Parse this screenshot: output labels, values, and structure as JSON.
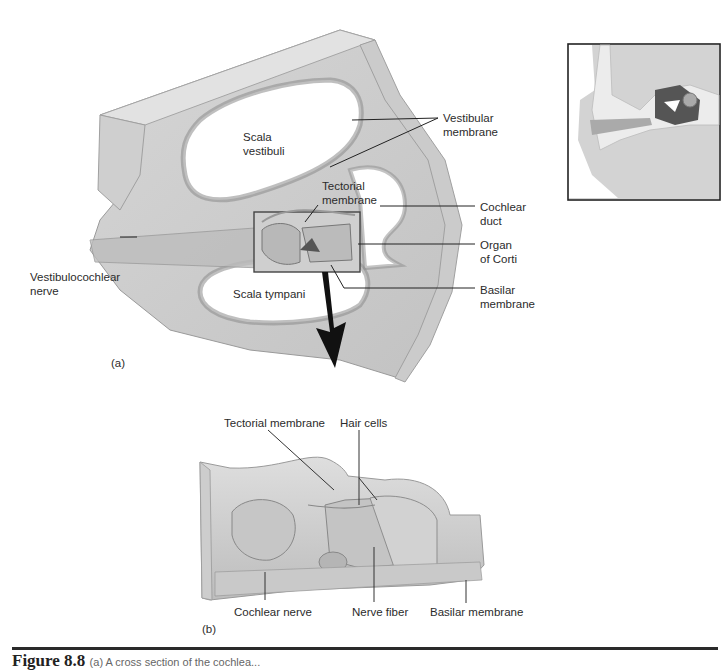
{
  "figure": {
    "panel_a": {
      "tag": "(a)",
      "labels": {
        "scala_vestibuli": [
          "Scala",
          "vestibuli"
        ],
        "vestibular_membrane": [
          "Vestibular",
          "membrane"
        ],
        "tectorial_membrane": [
          "Tectorial",
          "membrane"
        ],
        "cochlear_duct": [
          "Cochlear",
          "duct"
        ],
        "organ_of_corti": [
          "Organ",
          "of Corti"
        ],
        "vestibulocochlear_nerve": [
          "Vestibulocochlear",
          "nerve"
        ],
        "scala_tympani": "Scala tympani",
        "basilar_membrane": [
          "Basilar",
          "membrane"
        ]
      }
    },
    "panel_b": {
      "tag": "(b)",
      "labels": {
        "tectorial_membrane": "Tectorial membrane",
        "hair_cells": "Hair cells",
        "cochlear_nerve": "Cochlear nerve",
        "nerve_fiber": "Nerve fiber",
        "basilar_membrane": "Basilar membrane"
      }
    },
    "inset": {
      "subject": "ear cross-section locator"
    },
    "caption": {
      "lead": "Figure 8.8",
      "rest": "(a) A cross section of the cochlea..."
    }
  }
}
